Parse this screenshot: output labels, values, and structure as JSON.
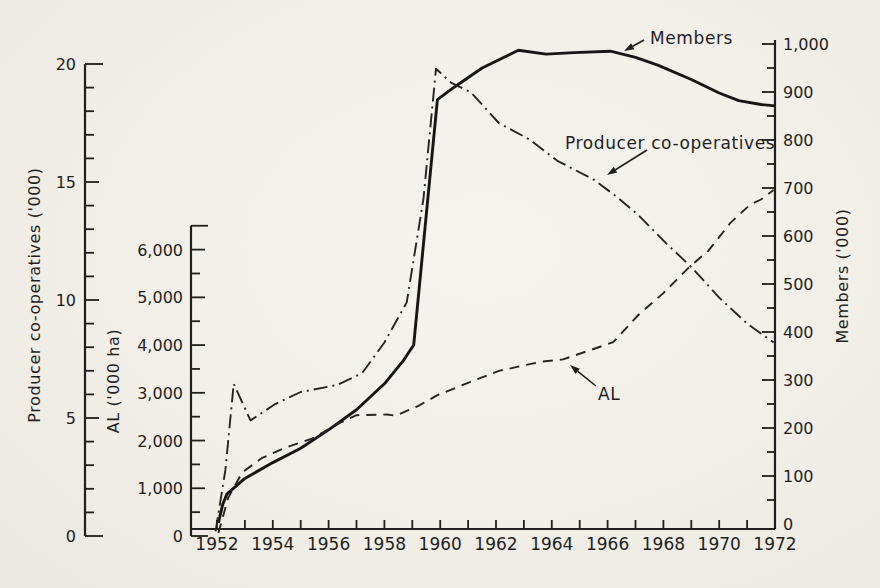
{
  "figure": {
    "background_color": "#f2f0ea",
    "ink_color": "#1f1f1f"
  },
  "chart_data": {
    "type": "line",
    "grid": false,
    "legend_position": "annotated-on-chart",
    "x_axis": {
      "unit": "year",
      "range": [
        1952,
        1972
      ],
      "tick_step": 1,
      "label_step": 2,
      "tick_labels": [
        "1952",
        "1954",
        "1956",
        "1958",
        "1960",
        "1962",
        "1964",
        "1966",
        "1968",
        "1970",
        "1972"
      ]
    },
    "axes": {
      "producer_coops": {
        "title": "Producer co-operatives ('000)",
        "side": "outer-left",
        "range": [
          0,
          20
        ],
        "major_tick": 5,
        "minor_tick": 1,
        "tick_labels": [
          "0",
          "5",
          "10",
          "15",
          "20"
        ]
      },
      "al": {
        "title": "AL ('000 ha)",
        "side": "inner-left",
        "range": [
          0,
          6500
        ],
        "major_tick": 1000,
        "minor_tick": 500,
        "tick_labels": [
          "0",
          "1,000",
          "2,000",
          "3,000",
          "4,000",
          "5,000",
          "6,000"
        ]
      },
      "members": {
        "title": "Members ('000)",
        "side": "right",
        "range": [
          0,
          1000
        ],
        "major_tick": 100,
        "minor_tick": 50,
        "tick_labels": [
          "0",
          "100",
          "200",
          "300",
          "400",
          "500",
          "600",
          "700",
          "800",
          "900",
          "1,000"
        ]
      }
    },
    "series": [
      {
        "name": "Members",
        "axis": "members",
        "line_style": "solid",
        "points": [
          [
            1952.05,
            2
          ],
          [
            1952.2,
            40
          ],
          [
            1952.35,
            62
          ],
          [
            1953,
            95
          ],
          [
            1954,
            128
          ],
          [
            1955,
            158
          ],
          [
            1956,
            196
          ],
          [
            1957,
            238
          ],
          [
            1958,
            292
          ],
          [
            1958.7,
            342
          ],
          [
            1959.05,
            373
          ],
          [
            1959.9,
            884
          ],
          [
            1960.5,
            910
          ],
          [
            1961.5,
            950
          ],
          [
            1962.8,
            987
          ],
          [
            1963.8,
            979
          ],
          [
            1964.8,
            982
          ],
          [
            1966.1,
            985
          ],
          [
            1967,
            972
          ],
          [
            1967.8,
            956
          ],
          [
            1969,
            926
          ],
          [
            1970,
            898
          ],
          [
            1970.7,
            882
          ],
          [
            1971.5,
            874
          ],
          [
            1972,
            871
          ]
        ]
      },
      {
        "name": "Producer co-operatives",
        "axis": "producer_coops",
        "line_style": "dashdot",
        "points": [
          [
            1951.95,
            0.2
          ],
          [
            1952.3,
            2.8
          ],
          [
            1952.6,
            6.45
          ],
          [
            1953.2,
            4.9
          ],
          [
            1954.1,
            5.6
          ],
          [
            1955,
            6.1
          ],
          [
            1956.3,
            6.4
          ],
          [
            1957.2,
            6.9
          ],
          [
            1958,
            8.2
          ],
          [
            1958.8,
            9.9
          ],
          [
            1959.4,
            14.3
          ],
          [
            1959.85,
            19.8
          ],
          [
            1960.4,
            19.2
          ],
          [
            1961.1,
            18.8
          ],
          [
            1962.1,
            17.5
          ],
          [
            1963.2,
            16.8
          ],
          [
            1964.2,
            15.9
          ],
          [
            1965.5,
            15.1
          ],
          [
            1966.3,
            14.4
          ],
          [
            1967.1,
            13.6
          ],
          [
            1968.1,
            12.4
          ],
          [
            1969,
            11.4
          ],
          [
            1970,
            10.1
          ],
          [
            1971,
            9.0
          ],
          [
            1971.95,
            8.2
          ]
        ]
      },
      {
        "name": "AL",
        "axis": "al",
        "line_style": "dashed",
        "points": [
          [
            1952.05,
            60
          ],
          [
            1952.4,
            800
          ],
          [
            1952.9,
            1330
          ],
          [
            1953.6,
            1630
          ],
          [
            1954.4,
            1840
          ],
          [
            1955.4,
            2040
          ],
          [
            1956.4,
            2370
          ],
          [
            1957,
            2530
          ],
          [
            1958.1,
            2545
          ],
          [
            1958.4,
            2520
          ],
          [
            1959.2,
            2720
          ],
          [
            1959.9,
            2950
          ],
          [
            1961,
            3210
          ],
          [
            1962.1,
            3460
          ],
          [
            1963.6,
            3650
          ],
          [
            1964.4,
            3700
          ],
          [
            1965.4,
            3900
          ],
          [
            1966.2,
            4060
          ],
          [
            1967.1,
            4630
          ],
          [
            1968,
            5090
          ],
          [
            1968.9,
            5620
          ],
          [
            1969.6,
            5970
          ],
          [
            1970.4,
            6560
          ],
          [
            1971.1,
            6940
          ],
          [
            1971.5,
            7050
          ],
          [
            1971.95,
            7250
          ]
        ]
      }
    ]
  }
}
